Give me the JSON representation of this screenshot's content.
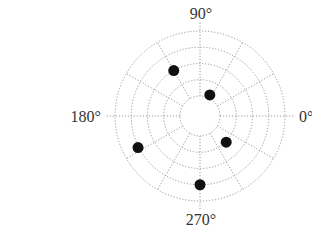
{
  "chart_data": {
    "type": "scatter",
    "subtype": "polar",
    "title": "",
    "angular_axis": {
      "unit": "degrees",
      "tick_labels": [
        {
          "angle": 0,
          "label": "0°"
        },
        {
          "angle": 90,
          "label": "90°"
        },
        {
          "angle": 180,
          "label": "180°"
        },
        {
          "angle": 270,
          "label": "270°"
        }
      ],
      "gridline_spacing_deg": 30
    },
    "radial_axis": {
      "rings": 5,
      "inner_hole": true,
      "tick_labels": [],
      "range": [
        1,
        5
      ]
    },
    "grid": true,
    "legend": null,
    "points": [
      {
        "theta": 120,
        "r": 3.0
      },
      {
        "theta": 65,
        "r": 1.2
      },
      {
        "theta": 315,
        "r": 2.05
      },
      {
        "theta": 207,
        "r": 4.05
      },
      {
        "theta": 270,
        "r": 4.0
      }
    ],
    "marker": {
      "shape": "circle",
      "color": "#111111"
    }
  },
  "layout": {
    "center": [
      200,
      116
    ],
    "ring_radii": [
      20,
      36.3,
      52.5,
      68.8,
      85
    ],
    "marker_radius": 5.5,
    "grid_color": "#9a9a9a",
    "label_color": "#333333"
  }
}
